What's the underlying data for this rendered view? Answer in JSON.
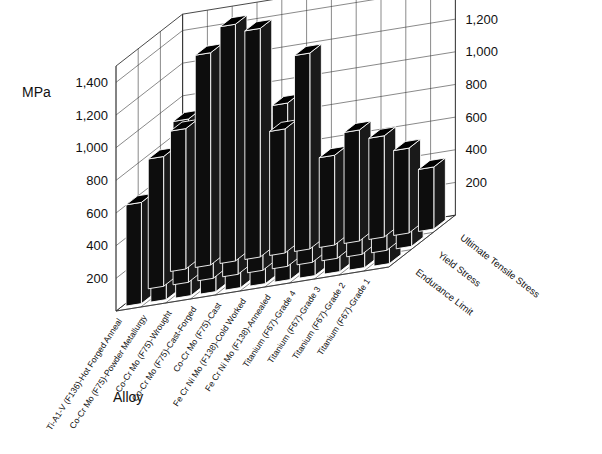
{
  "chart_data": {
    "type": "bar",
    "title": "",
    "subtitle": "",
    "xlabel": "Alloy",
    "ylabel": "MPa",
    "zlabel": "",
    "ylim": [
      0,
      1500
    ],
    "ytick_values": [
      200,
      400,
      600,
      800,
      1000,
      1200,
      1400
    ],
    "ytick_labels": [
      "200",
      "400",
      "600",
      "800",
      "1,000",
      "1,200",
      "1,400"
    ],
    "grid": true,
    "legend_position": "right-depth-axis",
    "projection": "3d-isometric",
    "categories": [
      "Ti-A1-V (F136)-Hot Forged Anneal",
      "Co-Cr Mo (F75)-Powder Metallurgy",
      "Co-Cr Mo (F75)-Wrought",
      "Co-Cr Mo (F75)-Cast-Forged",
      "Co-Cr Mo (F75)-Cast",
      "Fe Cr Ni Mo (F138)-Cold Worked",
      "Fe Cr Ni Mo (F138)-Annealed",
      "Titanium (F67)-Grade 4",
      "Titanium (F67)-Grade 3",
      "Titanium (F67)-Grade 2",
      "Titanium (F67)-Grade 1"
    ],
    "series": [
      {
        "name": "Ultimate Tensile Stress",
        "values": [
          860,
          1300,
          1450,
          1400,
          760,
          1200,
          550,
          680,
          620,
          520,
          380
        ]
      },
      {
        "name": "Yield Stress",
        "values": [
          795,
          1000,
          1050,
          900,
          500,
          1000,
          250,
          560,
          480,
          400,
          250
        ]
      },
      {
        "name": "Endurance Limit",
        "values": [
          620,
          730,
          800,
          700,
          300,
          480,
          220,
          330,
          300,
          250,
          190
        ]
      }
    ]
  },
  "axis": {
    "mpa_label": "MPa",
    "alloy_label": "Alloy",
    "left_ticks": [
      "1,400",
      "1,200",
      "1,000",
      "800",
      "600",
      "400",
      "200"
    ],
    "right_ticks": [
      "1,400",
      "1,200",
      "1,000",
      "800",
      "600",
      "400",
      "200"
    ]
  },
  "series_labels": {
    "s0": "Ultimate Tensile Stress",
    "s1": "Yield Stress",
    "s2": "Endurance Limit"
  },
  "category_labels": {
    "c0": "Ti-A1-V (F136)-Hot Forged Anneal",
    "c1": "Co-Cr Mo (F75)-Powder Metallurgy",
    "c2": "Co-Cr Mo (F75)-Wrought",
    "c3": "Co-Cr Mo (F75)-Cast-Forged",
    "c4": "Co-Cr Mo (F75)-Cast",
    "c5": "Fe Cr Ni Mo (F138)-Cold Worked",
    "c6": "Fe Cr Ni Mo (F138)-Annealed",
    "c7": "Titanium (F67)-Grade 4",
    "c8": "Titanium (F67)-Grade 3",
    "c9": "Titanium (F67)-Grade 2",
    "c10": "Titanium (F67)-Grade 1"
  },
  "colors": {
    "bar_front": "#0d0d0d",
    "bar_side": "#1a1a1a",
    "bar_top": "#000000",
    "grid": "#3a3a3a",
    "background": "#ffffff",
    "text": "#111111"
  }
}
